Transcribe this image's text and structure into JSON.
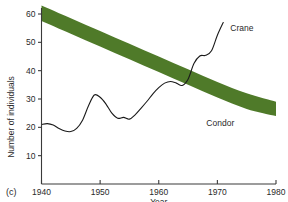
{
  "panel": {
    "label": "(c)"
  },
  "chart_data": {
    "type": "line",
    "title": "",
    "subtitle": "",
    "xlabel": "Year",
    "ylabel": "Number of individuals",
    "xlim": [
      1940,
      1980
    ],
    "ylim": [
      0,
      63
    ],
    "grid": false,
    "legend_position": "inline-right",
    "xticks": [
      1940,
      1950,
      1960,
      1970,
      1980
    ],
    "xtick_labels": [
      "1940",
      "1950",
      "1960",
      "1970",
      "1980"
    ],
    "yticks": [
      10,
      20,
      30,
      40,
      50,
      60
    ],
    "ytick_labels": [
      "10",
      "20",
      "30",
      "40",
      "50",
      "60"
    ],
    "series": [
      {
        "name": "Crane",
        "style": "line",
        "color": "#1a1a1a",
        "label_text": "Crane",
        "label_x": 1972.2,
        "label_y": 54.0,
        "x": [
          1940,
          1941,
          1942,
          1943,
          1944,
          1945,
          1946,
          1947,
          1948,
          1949,
          1950,
          1951,
          1952,
          1953,
          1954,
          1955,
          1956,
          1957,
          1958,
          1959,
          1960,
          1961,
          1962,
          1963,
          1964,
          1965,
          1966,
          1967,
          1968,
          1969,
          1970,
          1971
        ],
        "values": [
          21.0,
          21.3,
          20.8,
          19.6,
          18.7,
          18.5,
          19.6,
          22.5,
          27.5,
          31.4,
          30.6,
          28.2,
          25.0,
          23.2,
          23.5,
          22.9,
          24.5,
          26.8,
          29.2,
          31.8,
          34.0,
          35.6,
          36.2,
          35.6,
          34.8,
          37.0,
          42.5,
          45.2,
          45.4,
          47.0,
          52.5,
          57.0
        ]
      },
      {
        "name": "Condor",
        "style": "band",
        "color": "#4f7a29",
        "label_text": "Condor",
        "label_x": 1970.5,
        "label_y": 20.5,
        "x": [
          1940,
          1945,
          1950,
          1955,
          1960,
          1965,
          1970,
          1975,
          1980
        ],
        "upper": [
          63.0,
          58.5,
          54.0,
          49.5,
          45.0,
          40.5,
          36.0,
          32.0,
          29.0
        ],
        "lower": [
          57.5,
          53.0,
          48.5,
          44.0,
          39.5,
          35.0,
          30.5,
          26.5,
          24.0
        ]
      }
    ],
    "colors": {
      "condor_band": "#4f7a29",
      "crane_line": "#1a1a1a",
      "axis": "#3a3a3a",
      "background": "#ffffff"
    }
  }
}
